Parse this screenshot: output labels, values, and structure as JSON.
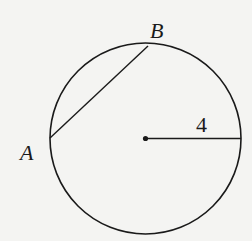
{
  "diagram": {
    "type": "geometry-circle",
    "background": "#f4f4f2",
    "stroke_color": "#1a1a1a",
    "circle": {
      "cx": 145.5,
      "cy": 138.5,
      "r": 95.5
    },
    "center_point": {
      "x": 145.5,
      "y": 138.5
    },
    "radius_segment": {
      "x1": 145.5,
      "y1": 138.5,
      "x2": 241,
      "y2": 138.5,
      "label": "4"
    },
    "chord": {
      "from": "A",
      "to": "B",
      "x1": 50,
      "y1": 138,
      "x2": 148,
      "y2": 46
    },
    "points": [
      {
        "name": "A",
        "label": "A",
        "x": 50,
        "y": 138,
        "label_x": 20,
        "label_y": 160
      },
      {
        "name": "B",
        "label": "B",
        "x": 148,
        "y": 46,
        "label_x": 150,
        "label_y": 38
      }
    ],
    "labels": {
      "point_a": "A",
      "point_b": "B",
      "radius_length": "4"
    }
  }
}
